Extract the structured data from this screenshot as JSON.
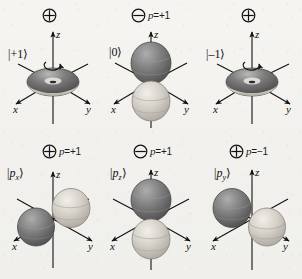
{
  "figure": {
    "background_color": "#f4f3f0",
    "ink_color": "#111111",
    "lobe_dark_color": "#6f6f6f",
    "lobe_light_color": "#cfcbc4"
  },
  "symbols": {
    "plus_circle": "circled-plus",
    "minus_circle": "circled-minus"
  },
  "axes": {
    "x_label": "x",
    "y_label": "y",
    "z_label": "z"
  },
  "panels": [
    {
      "id": "m-plus-1",
      "ket": "|+1⟩",
      "ket_base": "+1",
      "symbol": "circled-plus",
      "parity_text": "",
      "has_parity": false,
      "has_rotation_arrow": true,
      "shape": "torus",
      "row": 0,
      "column": 0
    },
    {
      "id": "m-zero",
      "ket": "|0⟩",
      "ket_base": "0",
      "symbol": "circled-minus",
      "parity_text": "p=+1",
      "parity_variable": "p",
      "parity_value": "=+1",
      "has_parity": true,
      "has_rotation_arrow": false,
      "shape": "dumbbell-z",
      "row": 0,
      "column": 1
    },
    {
      "id": "m-minus-1",
      "ket": "|–1⟩",
      "ket_base": "–1",
      "symbol": "circled-plus",
      "parity_text": "",
      "has_parity": false,
      "has_rotation_arrow": true,
      "shape": "torus",
      "row": 0,
      "column": 2
    },
    {
      "id": "p-x",
      "ket": "|pₓ⟩",
      "ket_base": "p",
      "ket_sub": "x",
      "symbol": "circled-plus",
      "parity_text": "p=+1",
      "parity_variable": "p",
      "parity_value": "=+1",
      "has_parity": true,
      "has_rotation_arrow": false,
      "shape": "dumbbell-x",
      "row": 1,
      "column": 0
    },
    {
      "id": "p-z",
      "ket": "|p₂⟩",
      "ket_base": "p",
      "ket_sub": "z",
      "symbol": "circled-minus",
      "parity_text": "p=+1",
      "parity_variable": "p",
      "parity_value": "=+1",
      "has_parity": true,
      "has_rotation_arrow": false,
      "shape": "dumbbell-z",
      "row": 1,
      "column": 1
    },
    {
      "id": "p-y",
      "ket": "|pᵧ⟩",
      "ket_base": "p",
      "ket_sub": "y",
      "symbol": "circled-plus",
      "parity_text": "p=−1",
      "parity_variable": "p",
      "parity_value": "=−1",
      "has_parity": true,
      "has_rotation_arrow": false,
      "shape": "dumbbell-y",
      "row": 1,
      "column": 2
    }
  ]
}
